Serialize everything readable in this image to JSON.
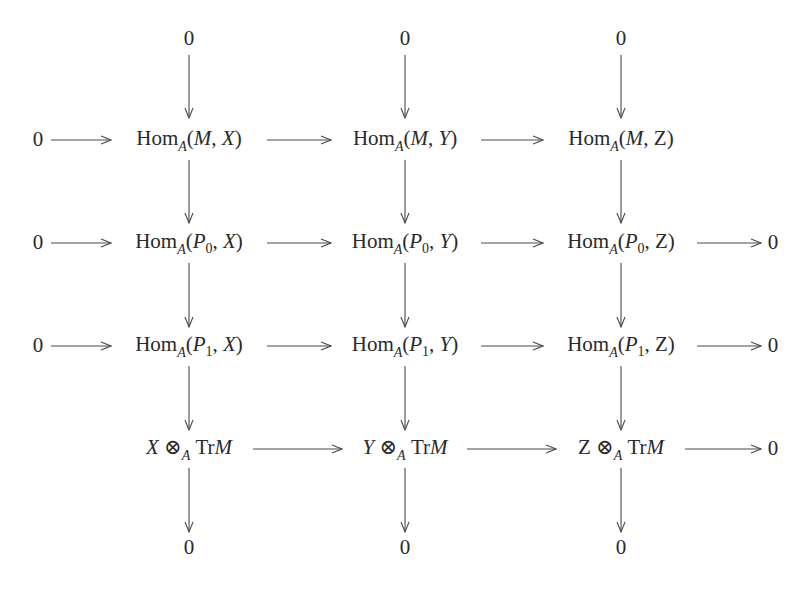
{
  "diagram": {
    "type": "commutative diagram",
    "zero": "0",
    "hom": "Hom",
    "ring": "A",
    "tensor": "⊗",
    "tr": "Tr",
    "M": "M",
    "comma": ", ",
    "lp": "(",
    "rp": ")",
    "columns": [
      {
        "name": "X",
        "center_x": 189
      },
      {
        "name": "Y",
        "center_x": 405
      },
      {
        "name": "Z",
        "center_x": 621
      }
    ],
    "rows": [
      {
        "id": "top-zeros",
        "label": "0",
        "center_y": 40
      },
      {
        "id": "hom-M",
        "first_arg": "M",
        "first_sub": "",
        "left_zero": true,
        "right_zero": false,
        "center_y": 140
      },
      {
        "id": "hom-P0",
        "first_arg": "P",
        "first_sub": "0",
        "left_zero": true,
        "right_zero": true,
        "center_y": 243
      },
      {
        "id": "hom-P1",
        "first_arg": "P",
        "first_sub": "1",
        "left_zero": true,
        "right_zero": true,
        "center_y": 346
      },
      {
        "id": "tensor-TrM",
        "left_zero": false,
        "right_zero": true,
        "center_y": 449
      },
      {
        "id": "bottom-zeros",
        "label": "0",
        "center_y": 548
      }
    ],
    "cells": {
      "r1": [
        "Hom_A(M, X)",
        "Hom_A(M, Y)",
        "Hom_A(M, Z)"
      ],
      "r2": [
        "Hom_A(P_0, X)",
        "Hom_A(P_0, Y)",
        "Hom_A(P_0, Z)"
      ],
      "r3": [
        "Hom_A(P_1, X)",
        "Hom_A(P_1, Y)",
        "Hom_A(P_1, Z)"
      ],
      "r4": [
        "X ⊗_A TrM",
        "Y ⊗_A TrM",
        "Z ⊗_A TrM"
      ]
    },
    "p0_sub": "0",
    "p1_sub": "1",
    "P": "P",
    "X": "X",
    "Y": "Y",
    "Z": "Z",
    "stroke_color": "#4a4a4a"
  }
}
